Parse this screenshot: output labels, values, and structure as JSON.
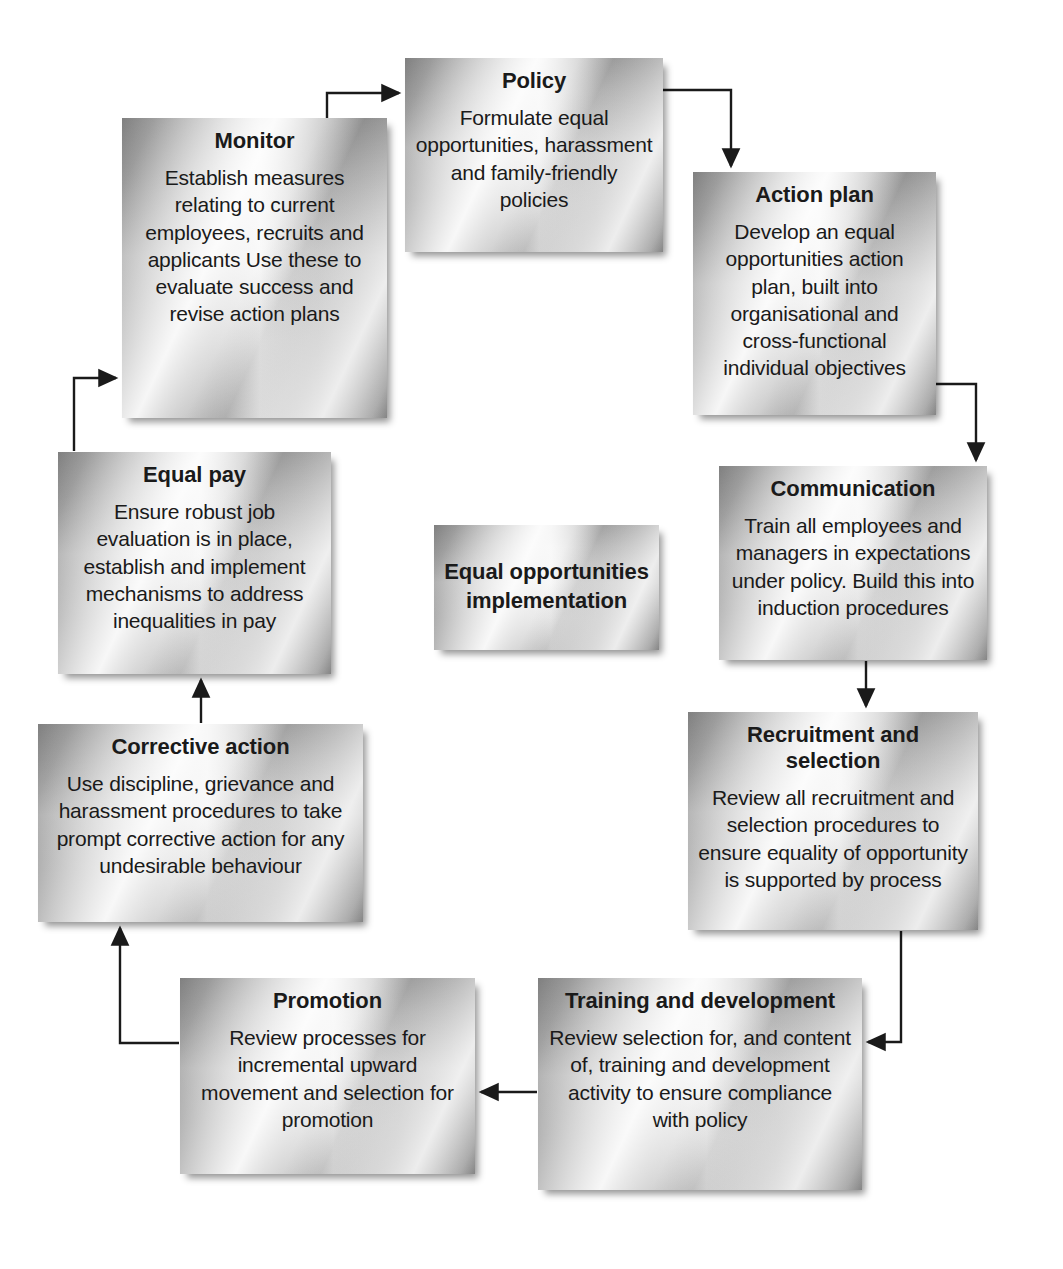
{
  "diagram": {
    "title": "Equal opportunities implementation",
    "type": "cycle-flow-diagram",
    "center": {
      "label": "Equal\nopportunities\nimplementation"
    },
    "nodes": [
      {
        "id": "policy",
        "title": "Policy",
        "body": "Formulate equal opportunities, harassment and family-friendly policies"
      },
      {
        "id": "action-plan",
        "title": "Action plan",
        "body": "Develop an equal opportunities action plan, built into organisational and cross-functional individual objectives"
      },
      {
        "id": "communication",
        "title": "Communication",
        "body": "Train all employees and managers in expectations under policy. Build this into induction procedures"
      },
      {
        "id": "recruitment-and-selection",
        "title": "Recruitment and selection",
        "body": "Review all recruitment and selection procedures to ensure equality of opportunity is supported by process"
      },
      {
        "id": "training-and-development",
        "title": "Training and development",
        "body": "Review selection for, and content of, training and development activity to ensure compliance with policy"
      },
      {
        "id": "promotion",
        "title": "Promotion",
        "body": "Review processes for incremental upward movement and selection for promotion"
      },
      {
        "id": "corrective-action",
        "title": "Corrective action",
        "body": "Use discipline, grievance and harassment procedures to take prompt corrective action for any undesirable behaviour"
      },
      {
        "id": "equal-pay",
        "title": "Equal pay",
        "body": "Ensure robust job evaluation is in place, establish and implement mechanisms to address inequalities in pay"
      },
      {
        "id": "monitor",
        "title": "Monitor",
        "body": "Establish measures relating to current employees, recruits and applicants Use these to evaluate success and revise action plans"
      }
    ],
    "edges": [
      {
        "from": "monitor",
        "to": "policy"
      },
      {
        "from": "policy",
        "to": "action-plan"
      },
      {
        "from": "action-plan",
        "to": "communication"
      },
      {
        "from": "communication",
        "to": "recruitment-and-selection"
      },
      {
        "from": "recruitment-and-selection",
        "to": "training-and-development"
      },
      {
        "from": "training-and-development",
        "to": "promotion"
      },
      {
        "from": "promotion",
        "to": "corrective-action"
      },
      {
        "from": "corrective-action",
        "to": "equal-pay"
      },
      {
        "from": "equal-pay",
        "to": "monitor"
      }
    ],
    "colors": {
      "connector": "#1a1a1a",
      "text": "#1a1a1a",
      "background": "#ffffff",
      "box_light": "#f2f2f2",
      "box_dark": "#8e8e8e"
    }
  }
}
